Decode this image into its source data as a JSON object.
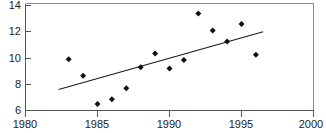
{
  "chart_data": {
    "type": "scatter",
    "title": "",
    "xlabel": "",
    "ylabel": "",
    "xlim": [
      1980,
      2000
    ],
    "ylim": [
      6,
      14
    ],
    "grid": false,
    "legend": null,
    "x_ticks": [
      1980,
      1985,
      1990,
      1995,
      2000
    ],
    "y_ticks": [
      6,
      8,
      10,
      12,
      14
    ],
    "x_tick_labels": [
      "1980",
      "1985",
      "1990",
      "1995",
      "2000"
    ],
    "y_tick_labels": [
      "6",
      "8",
      "10",
      "12",
      "14"
    ],
    "marker": "diamond",
    "marker_color": "#111111",
    "x": [
      1983,
      1984,
      1985,
      1986,
      1987,
      1988,
      1989,
      1990,
      1991,
      1992,
      1993,
      1994,
      1995,
      1996
    ],
    "values": [
      9.9,
      8.65,
      6.5,
      6.85,
      7.7,
      9.3,
      10.35,
      9.2,
      9.85,
      13.4,
      12.1,
      11.25,
      12.6,
      10.25
    ],
    "series": [
      {
        "name": "observations",
        "type": "scatter",
        "points": [
          {
            "x": 1983,
            "y": 9.9
          },
          {
            "x": 1984,
            "y": 8.65
          },
          {
            "x": 1985,
            "y": 6.5
          },
          {
            "x": 1986,
            "y": 6.85
          },
          {
            "x": 1987,
            "y": 7.7
          },
          {
            "x": 1988,
            "y": 9.3
          },
          {
            "x": 1989,
            "y": 10.35
          },
          {
            "x": 1990,
            "y": 9.2
          },
          {
            "x": 1991,
            "y": 9.85
          },
          {
            "x": 1992,
            "y": 13.4
          },
          {
            "x": 1993,
            "y": 12.1
          },
          {
            "x": 1994,
            "y": 11.25
          },
          {
            "x": 1995,
            "y": 12.6
          },
          {
            "x": 1996,
            "y": 10.25
          }
        ]
      },
      {
        "name": "trend-line",
        "type": "line",
        "points": [
          {
            "x": 1982.3,
            "y": 7.6
          },
          {
            "x": 1996.5,
            "y": 12.0
          }
        ]
      }
    ]
  },
  "colors": {
    "marker": "#111111",
    "trend": "#1a1a1a",
    "axis": "#555555",
    "frame": "#8a8a8a",
    "background": "#ffffff",
    "tick_text": "#1a1a1a"
  }
}
